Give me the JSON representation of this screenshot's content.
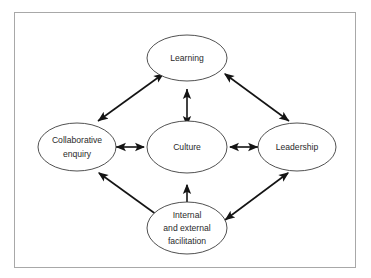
{
  "figure": {
    "type": "concept-map",
    "background_color": "#ffffff",
    "border_color": "#a8a8a8",
    "node_stroke_color": "#3d3d3d",
    "arrow_color": "#141414",
    "text_color": "#2a2a2a"
  },
  "nodes": [
    {
      "id": "learning",
      "label": "Learning",
      "lines": [
        "Learning"
      ],
      "position": "top",
      "cx": 186,
      "cy": 57,
      "rx": 40,
      "ry": 23
    },
    {
      "id": "collaborative-enquiry",
      "label": "Collaborative enquiry",
      "lines": [
        "Collaborative",
        "enquiry"
      ],
      "position": "left",
      "cx": 76,
      "cy": 142,
      "rx": 39,
      "ry": 24
    },
    {
      "id": "culture",
      "label": "Culture",
      "lines": [
        "Culture"
      ],
      "position": "center",
      "cx": 186,
      "cy": 142,
      "rx": 39,
      "ry": 25
    },
    {
      "id": "leadership",
      "label": "Leadership",
      "lines": [
        "Leadership"
      ],
      "position": "right",
      "cx": 292,
      "cy": 142,
      "rx": 39,
      "ry": 24
    },
    {
      "id": "internal-and-external-facilitation",
      "label": "Internal and external facilitation",
      "lines": [
        "Internal",
        "and external",
        "facilitation"
      ],
      "position": "bottom",
      "cx": 186,
      "cy": 226,
      "rx": 39,
      "ry": 26
    }
  ],
  "connections": [
    {
      "id": "culture-learning",
      "from": "culture",
      "to": "learning",
      "arrow": "double",
      "orientation": "vertical"
    },
    {
      "id": "culture-collaborative-enquiry",
      "from": "culture",
      "to": "collaborative-enquiry",
      "arrow": "double",
      "orientation": "horizontal"
    },
    {
      "id": "culture-leadership",
      "from": "culture",
      "to": "leadership",
      "arrow": "double",
      "orientation": "horizontal"
    },
    {
      "id": "culture-facilitation",
      "from": "culture",
      "to": "internal-and-external-facilitation",
      "arrow": "double",
      "orientation": "vertical"
    },
    {
      "id": "learning-collaborative-enquiry",
      "from": "learning",
      "to": "collaborative-enquiry",
      "arrow": "double",
      "orientation": "diagonal"
    },
    {
      "id": "learning-leadership",
      "from": "learning",
      "to": "leadership",
      "arrow": "double",
      "orientation": "diagonal"
    },
    {
      "id": "collaborative-enquiry-facilitation",
      "from": "collaborative-enquiry",
      "to": "internal-and-external-facilitation",
      "arrow": "double",
      "orientation": "diagonal"
    },
    {
      "id": "leadership-facilitation",
      "from": "leadership",
      "to": "internal-and-external-facilitation",
      "arrow": "double",
      "orientation": "diagonal"
    }
  ]
}
